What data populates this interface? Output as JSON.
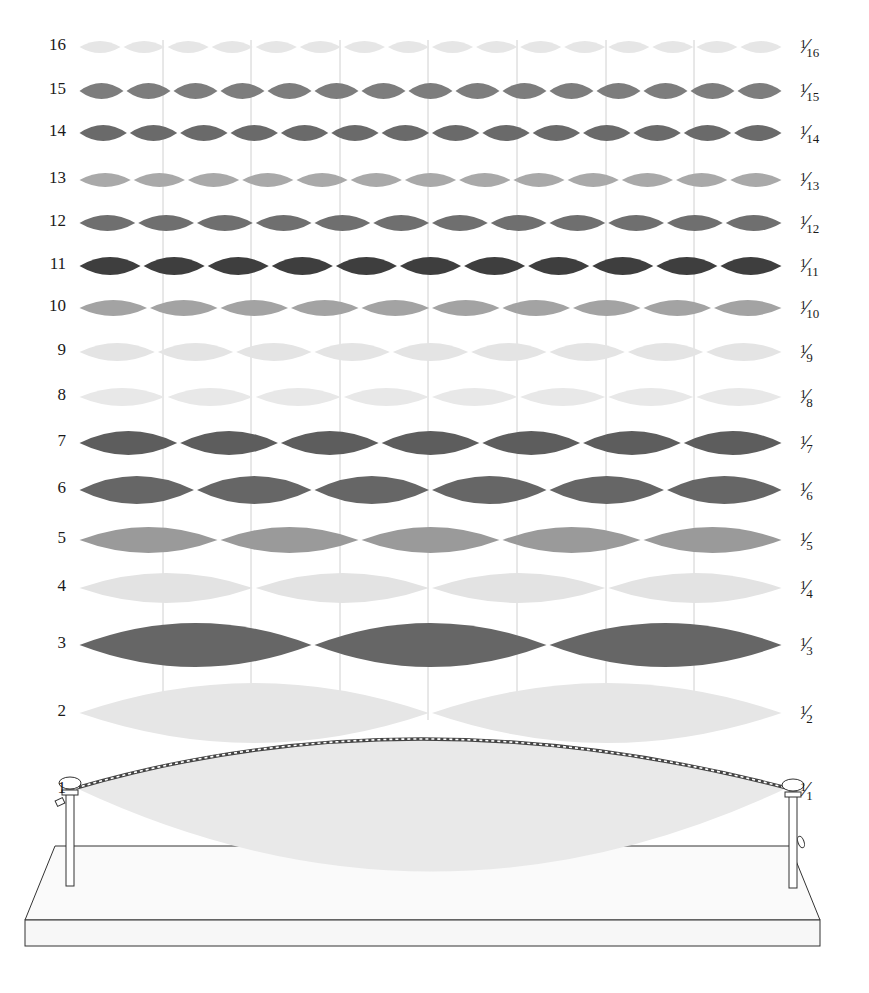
{
  "diagram": {
    "string_x_start": 78,
    "string_x_end": 783,
    "guide_lines_x": [
      163,
      251,
      340,
      428,
      517,
      606,
      694
    ],
    "rows": [
      {
        "n": 16,
        "label": "16",
        "fraction": {
          "num": "1",
          "den": "16"
        },
        "y": 47,
        "amp": 6,
        "color": "#e6e6e6"
      },
      {
        "n": 15,
        "label": "15",
        "fraction": {
          "num": "1",
          "den": "15"
        },
        "y": 91,
        "amp": 8,
        "color": "#7d7d7d"
      },
      {
        "n": 14,
        "label": "14",
        "fraction": {
          "num": "1",
          "den": "14"
        },
        "y": 133,
        "amp": 8,
        "color": "#6a6a6a"
      },
      {
        "n": 13,
        "label": "13",
        "fraction": {
          "num": "1",
          "den": "13"
        },
        "y": 180,
        "amp": 7,
        "color": "#a9a9a9"
      },
      {
        "n": 12,
        "label": "12",
        "fraction": {
          "num": "1",
          "den": "12"
        },
        "y": 223,
        "amp": 8,
        "color": "#6f6f6f"
      },
      {
        "n": 11,
        "label": "11",
        "fraction": {
          "num": "1",
          "den": "11"
        },
        "y": 266,
        "amp": 9,
        "color": "#3e3e3e"
      },
      {
        "n": 10,
        "label": "10",
        "fraction": {
          "num": "1",
          "den": "10"
        },
        "y": 308,
        "amp": 8,
        "color": "#a3a3a3"
      },
      {
        "n": 9,
        "label": "9",
        "fraction": {
          "num": "1",
          "den": "9"
        },
        "y": 352,
        "amp": 9,
        "color": "#e4e4e4"
      },
      {
        "n": 8,
        "label": "8",
        "fraction": {
          "num": "1",
          "den": "8"
        },
        "y": 397,
        "amp": 9,
        "color": "#e8e8e8"
      },
      {
        "n": 7,
        "label": "7",
        "fraction": {
          "num": "1",
          "den": "7"
        },
        "y": 443,
        "amp": 12,
        "color": "#5d5d5d"
      },
      {
        "n": 6,
        "label": "6",
        "fraction": {
          "num": "1",
          "den": "6"
        },
        "y": 490,
        "amp": 14,
        "color": "#666666"
      },
      {
        "n": 5,
        "label": "5",
        "fraction": {
          "num": "1",
          "den": "5"
        },
        "y": 540,
        "amp": 13,
        "color": "#9a9a9a"
      },
      {
        "n": 4,
        "label": "4",
        "fraction": {
          "num": "1",
          "den": "4"
        },
        "y": 588,
        "amp": 15,
        "color": "#e3e3e3"
      },
      {
        "n": 3,
        "label": "3",
        "fraction": {
          "num": "1",
          "den": "3"
        },
        "y": 645,
        "amp": 22,
        "color": "#666666"
      },
      {
        "n": 2,
        "label": "2",
        "fraction": {
          "num": "1",
          "den": "2"
        },
        "y": 713,
        "amp": 30,
        "color": "#e6e6e6"
      }
    ],
    "fundamental": {
      "n": 1,
      "label": "1",
      "fraction": {
        "num": "1",
        "den": "1"
      },
      "left_peg_x": 70,
      "right_peg_x": 793,
      "peg_top_y": 782,
      "string_top_y": 752,
      "lobe_bottom_y": 885,
      "fill": "#e9e9e9"
    },
    "board": {
      "fill": "#fafafa",
      "stroke": "#333333"
    },
    "colors": {
      "background": "#ffffff",
      "guide_line": "#d0d0d0",
      "label_text": "#1a1a1a"
    }
  }
}
